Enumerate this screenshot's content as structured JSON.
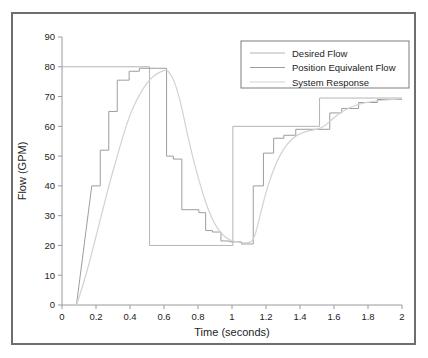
{
  "chart_data": {
    "type": "line",
    "title": "",
    "xlabel": "Time (seconds)",
    "ylabel": "Flow (GPM)",
    "xlim": [
      0,
      2
    ],
    "ylim": [
      0,
      90
    ],
    "xticks": [
      "0",
      "0.2",
      "0.4",
      "0.6",
      "0.8",
      "1",
      "1.2",
      "1.4",
      "1.6",
      "1.8",
      "2"
    ],
    "xtick_values": [
      0,
      0.2,
      0.4,
      0.6,
      0.8,
      1.0,
      1.2,
      1.4,
      1.6,
      1.8,
      2.0
    ],
    "yticks": [
      "0",
      "10",
      "20",
      "30",
      "40",
      "50",
      "60",
      "70",
      "80",
      "90"
    ],
    "ytick_values": [
      0,
      10,
      20,
      30,
      40,
      50,
      60,
      70,
      80,
      90
    ],
    "grid": false,
    "legend_position": "top-right",
    "series": [
      {
        "name": "Desired Flow",
        "color": "#b4b4b4",
        "width": 1.0,
        "style": "step",
        "points": [
          [
            0.0,
            80
          ],
          [
            0.515,
            80
          ],
          [
            0.515,
            20
          ],
          [
            1.005,
            20
          ],
          [
            1.005,
            60
          ],
          [
            1.515,
            60
          ],
          [
            1.515,
            69.5
          ],
          [
            2.0,
            69.5
          ]
        ]
      },
      {
        "name": "Position Equivalent Flow",
        "color": "#9d9d9d",
        "width": 1.0,
        "style": "step",
        "points": [
          [
            0.085,
            0
          ],
          [
            0.175,
            40
          ],
          [
            0.225,
            40
          ],
          [
            0.225,
            52
          ],
          [
            0.275,
            52
          ],
          [
            0.275,
            65
          ],
          [
            0.325,
            65
          ],
          [
            0.325,
            75.5
          ],
          [
            0.395,
            75.5
          ],
          [
            0.395,
            78.5
          ],
          [
            0.455,
            78.5
          ],
          [
            0.455,
            79.5
          ],
          [
            0.555,
            79.5
          ],
          [
            0.615,
            79.5
          ],
          [
            0.615,
            50
          ],
          [
            0.655,
            50
          ],
          [
            0.655,
            49
          ],
          [
            0.705,
            49
          ],
          [
            0.705,
            32
          ],
          [
            0.805,
            32
          ],
          [
            0.805,
            31
          ],
          [
            0.845,
            31
          ],
          [
            0.845,
            25
          ],
          [
            0.885,
            25
          ],
          [
            0.885,
            24.5
          ],
          [
            0.935,
            24.5
          ],
          [
            0.935,
            21.5
          ],
          [
            0.985,
            21.5
          ],
          [
            0.985,
            21.2
          ],
          [
            1.055,
            21.2
          ],
          [
            1.055,
            20.5
          ],
          [
            1.125,
            20.5
          ],
          [
            1.125,
            40
          ],
          [
            1.185,
            40
          ],
          [
            1.185,
            51
          ],
          [
            1.245,
            51
          ],
          [
            1.245,
            56
          ],
          [
            1.305,
            56
          ],
          [
            1.305,
            57
          ],
          [
            1.375,
            57
          ],
          [
            1.375,
            59
          ],
          [
            1.575,
            59
          ],
          [
            1.575,
            64.5
          ],
          [
            1.645,
            64.5
          ],
          [
            1.645,
            66
          ],
          [
            1.745,
            66
          ],
          [
            1.745,
            68
          ],
          [
            1.855,
            68
          ],
          [
            1.855,
            69
          ],
          [
            2.0,
            69
          ]
        ]
      },
      {
        "name": "System Response",
        "color": "#d2d2d2",
        "width": 1.2,
        "style": "smooth",
        "points": [
          [
            0.085,
            0
          ],
          [
            0.12,
            6
          ],
          [
            0.16,
            14
          ],
          [
            0.2,
            23
          ],
          [
            0.24,
            32
          ],
          [
            0.28,
            41
          ],
          [
            0.32,
            49
          ],
          [
            0.36,
            57
          ],
          [
            0.4,
            64
          ],
          [
            0.44,
            69
          ],
          [
            0.48,
            73
          ],
          [
            0.52,
            76
          ],
          [
            0.56,
            77.8
          ],
          [
            0.6,
            78.8
          ],
          [
            0.62,
            79
          ],
          [
            0.655,
            76
          ],
          [
            0.69,
            70
          ],
          [
            0.72,
            62
          ],
          [
            0.755,
            53
          ],
          [
            0.79,
            45
          ],
          [
            0.825,
            38
          ],
          [
            0.86,
            32
          ],
          [
            0.895,
            27.5
          ],
          [
            0.93,
            24.5
          ],
          [
            0.965,
            22.5
          ],
          [
            1.0,
            21.5
          ],
          [
            1.05,
            21.0
          ],
          [
            1.1,
            20.8
          ],
          [
            1.13,
            22
          ],
          [
            1.165,
            30
          ],
          [
            1.2,
            38
          ],
          [
            1.235,
            44
          ],
          [
            1.27,
            49
          ],
          [
            1.305,
            52.5
          ],
          [
            1.34,
            55
          ],
          [
            1.375,
            56.8
          ],
          [
            1.41,
            57.8
          ],
          [
            1.45,
            58.5
          ],
          [
            1.5,
            59
          ],
          [
            1.545,
            60
          ],
          [
            1.59,
            62.5
          ],
          [
            1.635,
            64.5
          ],
          [
            1.68,
            66
          ],
          [
            1.725,
            67
          ],
          [
            1.77,
            67.8
          ],
          [
            1.82,
            68.3
          ],
          [
            1.87,
            68.7
          ],
          [
            1.93,
            69
          ],
          [
            2.0,
            69.3
          ]
        ]
      }
    ]
  },
  "legend": {
    "entries": [
      {
        "label": "Desired Flow"
      },
      {
        "label": "Position Equivalent Flow"
      },
      {
        "label": "System Response"
      }
    ]
  },
  "colors": {
    "frame": "#6e6e6e",
    "axis": "#9a9a9a",
    "text": "#1d1d1d",
    "background": "#ffffff"
  }
}
